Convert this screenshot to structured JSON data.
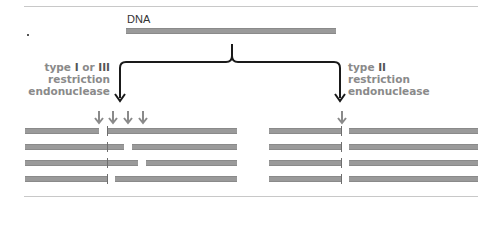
{
  "diagram": {
    "title_label": "DNA",
    "left_enzyme": {
      "line1_prefix": "type ",
      "line1_roman_a": "I",
      "line1_mid": " or ",
      "line1_roman_b": "III",
      "line2": "restriction",
      "line3": "endonuclease"
    },
    "right_enzyme": {
      "line1_prefix": "type ",
      "line1_roman": "II",
      "line2": "restriction",
      "line3": "endonuclease"
    },
    "left_panel": {
      "description": "Type I/III: cuts at variable sites away from recognition site",
      "cut_arrows": 4,
      "rows": [
        {
          "segments": [
            [
              25,
              99
            ],
            [
              107,
              237
            ]
          ],
          "mark": 107
        },
        {
          "segments": [
            [
              25,
              124
            ],
            [
              132,
              237
            ]
          ],
          "mark": 107
        },
        {
          "segments": [
            [
              25,
              138
            ],
            [
              146,
              237
            ]
          ],
          "mark": 107
        },
        {
          "segments": [
            [
              25,
              107
            ],
            [
              115,
              237
            ]
          ],
          "mark": 107
        }
      ]
    },
    "right_panel": {
      "description": "Type II: cuts at a fixed site",
      "cut_arrows": 1,
      "rows": [
        {
          "segments": [
            [
              269,
              341
            ],
            [
              349,
              478
            ]
          ],
          "mark": 341
        },
        {
          "segments": [
            [
              269,
              341
            ],
            [
              349,
              478
            ]
          ],
          "mark": 341
        },
        {
          "segments": [
            [
              269,
              341
            ],
            [
              349,
              478
            ]
          ],
          "mark": 341
        },
        {
          "segments": [
            [
              269,
              341
            ],
            [
              349,
              478
            ]
          ],
          "mark": 341
        }
      ]
    },
    "colors": {
      "bar": "#9a9a9a",
      "arrow_small": "#8a8a8a",
      "bracket": "#1a1a1a",
      "rule": "#c8c8c8"
    }
  }
}
